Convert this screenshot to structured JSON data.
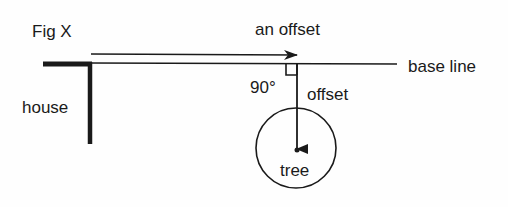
{
  "figure": {
    "title": "Fig X",
    "labels": {
      "an_offset": "an offset",
      "base_line": "base line",
      "house": "house",
      "angle": "90°",
      "offset": "offset",
      "tree": "tree"
    },
    "colors": {
      "ink": "#1a1a1a",
      "background": "#fefefe"
    }
  }
}
